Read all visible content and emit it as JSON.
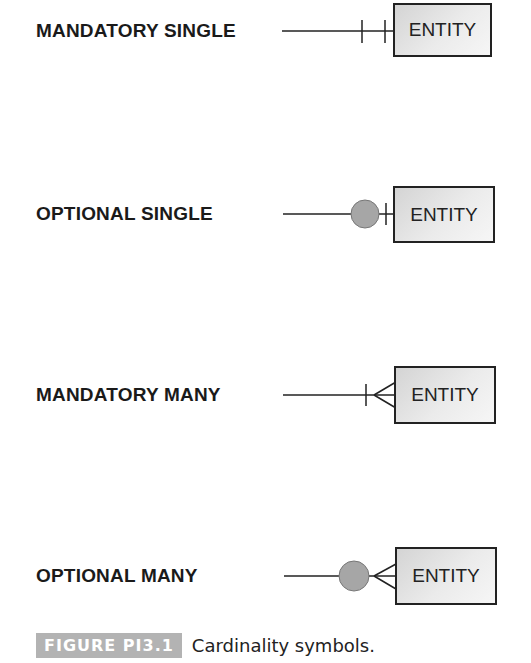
{
  "rows": [
    {
      "label": "MANDATORY SINGLE",
      "entity": "ENTITY",
      "symbol": "mandatory-single"
    },
    {
      "label": "OPTIONAL SINGLE",
      "entity": "ENTITY",
      "symbol": "optional-single"
    },
    {
      "label": "MANDATORY MANY",
      "entity": "ENTITY",
      "symbol": "mandatory-many"
    },
    {
      "label": "OPTIONAL MANY",
      "entity": "ENTITY",
      "symbol": "optional-many"
    }
  ],
  "caption": {
    "figure_label": "FIGURE PI3.1",
    "text": "Cardinality symbols."
  },
  "colors": {
    "line": "#222222",
    "circle_fill": "#a6a6a6",
    "badge_bg": "#b3b3b3"
  }
}
